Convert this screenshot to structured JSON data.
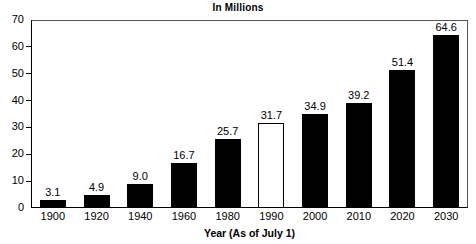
{
  "chart_data": {
    "type": "bar",
    "title": "In Millions",
    "subtitle": "",
    "xlabel": "Year (As of July 1)",
    "ylabel": "",
    "categories": [
      "1900",
      "1920",
      "1940",
      "1960",
      "1980",
      "1990",
      "2000",
      "2010",
      "2020",
      "2030"
    ],
    "values": [
      3.1,
      4.9,
      9.0,
      16.7,
      25.7,
      31.7,
      34.9,
      39.2,
      51.4,
      64.6
    ],
    "value_labels": [
      "3.1",
      "4.9",
      "9.0",
      "16.7",
      "25.7",
      "31.7",
      "34.9",
      "39.2",
      "51.4",
      "64.6"
    ],
    "bar_styles": [
      "filled",
      "filled",
      "filled",
      "filled",
      "filled",
      "hollow",
      "filled",
      "filled",
      "filled",
      "filled"
    ],
    "ylim": [
      0,
      70
    ],
    "yticks": [
      0,
      10,
      20,
      30,
      40,
      50,
      60,
      70
    ],
    "ytick_labels": [
      "0",
      "10",
      "20",
      "30",
      "40",
      "50",
      "60",
      "70"
    ],
    "grid": false,
    "legend": null,
    "legend_position": "none",
    "colors": {
      "bar_filled": "#000000",
      "bar_hollow_fill": "#ffffff",
      "bar_outline": "#000000",
      "axis": "#000000",
      "frame": "#555555",
      "text": "#000000",
      "background": "#ffffff"
    }
  }
}
